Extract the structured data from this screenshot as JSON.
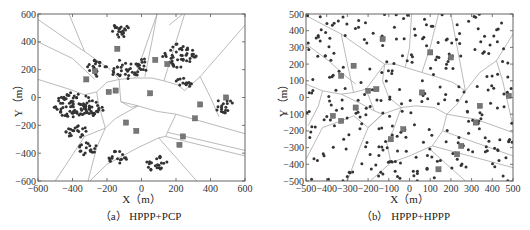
{
  "chart_data": [
    {
      "type": "scatter",
      "title": "(a) HPPP+PCP",
      "caption": "（a） HPPP+PCP",
      "xlabel": "X（m）",
      "ylabel": "Y（m）",
      "xlim": [
        -600,
        600
      ],
      "ylim": [
        -600,
        600
      ],
      "xticks": [
        -600,
        -400,
        -200,
        0,
        200,
        400,
        600
      ],
      "yticks": [
        -600,
        -400,
        -200,
        0,
        200,
        400,
        600
      ],
      "grid": false,
      "series": [
        {
          "name": "base-stations",
          "marker": "square",
          "points": [
            [
              -140,
              350
            ],
            [
              -270,
              190
            ],
            [
              -320,
              130
            ],
            [
              -150,
              50
            ],
            [
              -190,
              40
            ],
            [
              50,
              30
            ],
            [
              80,
              270
            ],
            [
              150,
              240
            ],
            [
              490,
              0
            ],
            [
              340,
              -50
            ],
            [
              310,
              -150
            ],
            [
              -90,
              -180
            ],
            [
              -30,
              -240
            ],
            [
              240,
              -280
            ],
            [
              220,
              -340
            ]
          ]
        },
        {
          "name": "users",
          "marker": "dot",
          "clusters": [
            {
              "center": [
                -120,
                480
              ],
              "radius": 60,
              "count": 20
            },
            {
              "center": [
                -260,
                210
              ],
              "radius": 70,
              "count": 18
            },
            {
              "center": [
                -90,
                200
              ],
              "radius": 90,
              "count": 30
            },
            {
              "center": [
                20,
                240
              ],
              "radius": 60,
              "count": 12
            },
            {
              "center": [
                220,
                300
              ],
              "radius": 100,
              "count": 45
            },
            {
              "center": [
                250,
                110
              ],
              "radius": 50,
              "count": 15
            },
            {
              "center": [
                -400,
                -50
              ],
              "radius": 110,
              "count": 70
            },
            {
              "center": [
                -280,
                -80
              ],
              "radius": 70,
              "count": 30
            },
            {
              "center": [
                -380,
                -240
              ],
              "radius": 60,
              "count": 20
            },
            {
              "center": [
                -310,
                -370
              ],
              "radius": 55,
              "count": 18
            },
            {
              "center": [
                -140,
                -430
              ],
              "radius": 55,
              "count": 18
            },
            {
              "center": [
                90,
                -470
              ],
              "radius": 70,
              "count": 22
            },
            {
              "center": [
                480,
                -60
              ],
              "radius": 60,
              "count": 18
            }
          ]
        }
      ],
      "voronoi_edges": [
        [
          [
            -600,
            560
          ],
          [
            -330,
            330
          ],
          [
            -180,
            200
          ],
          [
            -130,
            130
          ]
        ],
        [
          [
            -600,
            400
          ],
          [
            -400,
            280
          ],
          [
            -270,
            130
          ]
        ],
        [
          [
            -600,
            130
          ],
          [
            -420,
            60
          ],
          [
            -330,
            20
          ],
          [
            -260,
            40
          ],
          [
            -200,
            110
          ],
          [
            -130,
            130
          ]
        ],
        [
          [
            -130,
            130
          ],
          [
            -40,
            140
          ],
          [
            60,
            140
          ],
          [
            130,
            120
          ],
          [
            210,
            90
          ],
          [
            250,
            50
          ],
          [
            340,
            150
          ]
        ],
        [
          [
            -40,
            140
          ],
          [
            90,
            600
          ]
        ],
        [
          [
            90,
            600
          ],
          [
            60,
            400
          ],
          [
            20,
            150
          ]
        ],
        [
          [
            250,
            600
          ],
          [
            150,
            200
          ],
          [
            130,
            120
          ]
        ],
        [
          [
            340,
            150
          ],
          [
            600,
            520
          ]
        ],
        [
          [
            340,
            150
          ],
          [
            400,
            0
          ],
          [
            450,
            -140
          ]
        ],
        [
          [
            -130,
            130
          ],
          [
            -120,
            -30
          ],
          [
            -60,
            -70
          ],
          [
            -20,
            -60
          ]
        ],
        [
          [
            -20,
            -60
          ],
          [
            90,
            -100
          ],
          [
            200,
            -120
          ]
        ],
        [
          [
            200,
            -120
          ],
          [
            600,
            -260
          ]
        ],
        [
          [
            200,
            -120
          ],
          [
            150,
            -250
          ],
          [
            140,
            -280
          ],
          [
            100,
            -290
          ]
        ],
        [
          [
            140,
            -280
          ],
          [
            600,
            -420
          ]
        ],
        [
          [
            150,
            -250
          ],
          [
            600,
            -380
          ]
        ],
        [
          [
            100,
            -290
          ],
          [
            320,
            -600
          ]
        ],
        [
          [
            100,
            -290
          ],
          [
            -20,
            -360
          ],
          [
            -200,
            -480
          ],
          [
            -300,
            -600
          ]
        ],
        [
          [
            -20,
            -60
          ],
          [
            -150,
            -150
          ],
          [
            -210,
            -220
          ],
          [
            -260,
            -360
          ],
          [
            -310,
            -600
          ]
        ],
        [
          [
            -210,
            -220
          ],
          [
            -330,
            -280
          ],
          [
            -420,
            -450
          ],
          [
            -500,
            -600
          ]
        ],
        [
          [
            -260,
            40
          ],
          [
            -250,
            -40
          ],
          [
            -210,
            -220
          ]
        ],
        [
          [
            240,
            600
          ],
          [
            160,
            520
          ]
        ],
        [
          [
            -420,
            600
          ],
          [
            -330,
            330
          ]
        ],
        [
          [
            -20,
            -60
          ],
          [
            -120,
            -30
          ]
        ]
      ]
    },
    {
      "type": "scatter",
      "title": "(b) HPPP+HPPP",
      "caption": "（b） HPPP+HPPP",
      "xlabel": "X（m）",
      "ylabel": "Y（m）",
      "xlim": [
        -500,
        500
      ],
      "ylim": [
        -500,
        500
      ],
      "xticks": [
        -500,
        -400,
        -300,
        -200,
        -100,
        0,
        100,
        200,
        300,
        400,
        500
      ],
      "yticks": [
        -500,
        -400,
        -300,
        -200,
        -100,
        0,
        100,
        200,
        300,
        400,
        500
      ],
      "grid": false,
      "series": [
        {
          "name": "base-stations",
          "marker": "square",
          "points": [
            [
              -330,
              130
            ],
            [
              -270,
              190
            ],
            [
              -260,
              -60
            ],
            [
              -370,
              -110
            ],
            [
              -330,
              -140
            ],
            [
              -200,
              40
            ],
            [
              -160,
              50
            ],
            [
              -130,
              350
            ],
            [
              100,
              270
            ],
            [
              200,
              240
            ],
            [
              60,
              30
            ],
            [
              340,
              -50
            ],
            [
              320,
              -150
            ],
            [
              -30,
              -190
            ],
            [
              -90,
              -250
            ],
            [
              250,
              -290
            ],
            [
              230,
              -340
            ],
            [
              480,
              10
            ],
            [
              140,
              -430
            ]
          ]
        },
        {
          "name": "users",
          "marker": "dot",
          "random": {
            "count": 300,
            "seed": 7
          }
        }
      ],
      "voronoi_edges": [
        [
          [
            -500,
            490
          ],
          [
            -330,
            380
          ],
          [
            -180,
            250
          ],
          [
            -120,
            200
          ],
          [
            -70,
            200
          ],
          [
            -20,
            180
          ]
        ],
        [
          [
            -500,
            320
          ],
          [
            -390,
            220
          ],
          [
            -330,
            150
          ],
          [
            -260,
            80
          ]
        ],
        [
          [
            -500,
            80
          ],
          [
            -420,
            40
          ],
          [
            -330,
            20
          ],
          [
            -270,
            30
          ],
          [
            -210,
            50
          ],
          [
            -120,
            200
          ]
        ],
        [
          [
            -330,
            20
          ],
          [
            -230,
            -40
          ],
          [
            -170,
            -80
          ],
          [
            -130,
            -100
          ]
        ],
        [
          [
            -420,
            40
          ],
          [
            -440,
            -50
          ],
          [
            -490,
            -170
          ]
        ],
        [
          [
            -500,
            -370
          ],
          [
            -420,
            -180
          ],
          [
            -330,
            -140
          ],
          [
            -270,
            -110
          ],
          [
            -200,
            -180
          ]
        ],
        [
          [
            -200,
            -180
          ],
          [
            -140,
            -110
          ],
          [
            -130,
            -100
          ]
        ],
        [
          [
            -130,
            -100
          ],
          [
            -40,
            -60
          ],
          [
            30,
            -50
          ],
          [
            120,
            -60
          ],
          [
            180,
            -100
          ]
        ],
        [
          [
            -20,
            180
          ],
          [
            60,
            150
          ],
          [
            140,
            120
          ],
          [
            210,
            90
          ],
          [
            270,
            40
          ]
        ],
        [
          [
            -20,
            180
          ],
          [
            0,
            300
          ],
          [
            10,
            500
          ]
        ],
        [
          [
            140,
            500
          ],
          [
            100,
            300
          ],
          [
            60,
            150
          ]
        ],
        [
          [
            270,
            40
          ],
          [
            200,
            500
          ]
        ],
        [
          [
            270,
            40
          ],
          [
            340,
            150
          ],
          [
            420,
            220
          ],
          [
            500,
            380
          ]
        ],
        [
          [
            270,
            40
          ],
          [
            230,
            -40
          ],
          [
            180,
            -100
          ]
        ],
        [
          [
            420,
            220
          ],
          [
            450,
            100
          ],
          [
            500,
            -170
          ]
        ],
        [
          [
            180,
            -100
          ],
          [
            320,
            -130
          ],
          [
            500,
            -210
          ]
        ],
        [
          [
            180,
            -100
          ],
          [
            160,
            -200
          ],
          [
            110,
            -290
          ],
          [
            90,
            -300
          ]
        ],
        [
          [
            160,
            -200
          ],
          [
            500,
            -350
          ]
        ],
        [
          [
            110,
            -290
          ],
          [
            500,
            -420
          ]
        ],
        [
          [
            90,
            -300
          ],
          [
            270,
            -500
          ]
        ],
        [
          [
            90,
            -300
          ],
          [
            0,
            -350
          ],
          [
            -90,
            -390
          ],
          [
            -190,
            -500
          ]
        ],
        [
          [
            -130,
            -100
          ],
          [
            -200,
            -180
          ],
          [
            -240,
            -300
          ],
          [
            -300,
            -500
          ]
        ],
        [
          [
            -40,
            -60
          ],
          [
            -80,
            -200
          ],
          [
            -110,
            -270
          ],
          [
            -90,
            -390
          ]
        ],
        [
          [
            -120,
            200
          ],
          [
            -130,
            100
          ],
          [
            -100,
            0
          ],
          [
            -40,
            -60
          ]
        ],
        [
          [
            -210,
            50
          ],
          [
            -170,
            -80
          ]
        ],
        [
          [
            -270,
            30
          ],
          [
            -300,
            200
          ],
          [
            -330,
            380
          ]
        ]
      ]
    }
  ],
  "panels": [
    {
      "caption": "（a） HPPP+PCP",
      "xlabel": "X（m）",
      "ylabel": "Y（m）"
    },
    {
      "caption": "（b） HPPP+HPPP",
      "xlabel": "X（m）",
      "ylabel": "Y（m）"
    }
  ],
  "colors": {
    "frame": "#555555",
    "edge": "#a8a8a8",
    "dot": "#333333",
    "square": "#777777",
    "text": "#222222"
  }
}
